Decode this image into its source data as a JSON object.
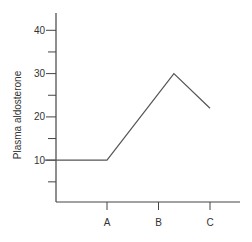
{
  "chart_data": {
    "type": "line",
    "title": "",
    "xlabel": "",
    "ylabel": "Plasma aldosterone",
    "ylim": [
      0,
      44
    ],
    "yticks_major": [
      10,
      20,
      30,
      40
    ],
    "yticks_major_labels": [
      "10",
      "20",
      "30",
      "40"
    ],
    "yticks_minor": [
      5,
      15,
      25,
      35
    ],
    "x_categories": [
      "A",
      "B",
      "C"
    ],
    "x_category_positions": [
      1,
      2,
      3
    ],
    "xlim": [
      -0.0,
      3.6
    ],
    "grid": false,
    "legend": null,
    "series": [
      {
        "name": "Plasma aldosterone",
        "points": [
          {
            "x": -0.2,
            "y": 10
          },
          {
            "x": 1.0,
            "y": 10
          },
          {
            "x": 2.3,
            "y": 30
          },
          {
            "x": 3.0,
            "y": 22
          }
        ]
      }
    ]
  },
  "colors": {
    "axis": "#444444",
    "line": "#555555",
    "text": "#333333"
  }
}
